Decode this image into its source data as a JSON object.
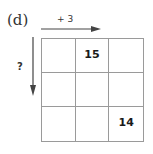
{
  "problem": {
    "label": "(d)",
    "row_operation": "+ 3",
    "column_operation": "?"
  },
  "grid": {
    "rows": 3,
    "cols": 3,
    "cells": [
      [
        "",
        "15",
        ""
      ],
      [
        "",
        "",
        ""
      ],
      [
        "",
        "",
        "14"
      ]
    ]
  },
  "colors": {
    "arrow": "#444444",
    "grid_line": "#9a9a9a",
    "text": "#1a1a1a"
  }
}
